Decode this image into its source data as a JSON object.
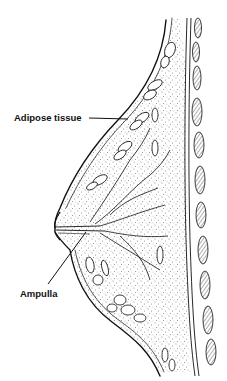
{
  "figure": {
    "type": "anatomical-cross-section",
    "style": "black ink line drawing with stippling",
    "colors": {
      "ink": "#111111",
      "background": "#ffffff",
      "hatch": "#333333"
    }
  },
  "labels": [
    {
      "id": "adipose",
      "text": "Adipose tissue"
    },
    {
      "id": "ampulla",
      "text": "Ampulla"
    }
  ]
}
